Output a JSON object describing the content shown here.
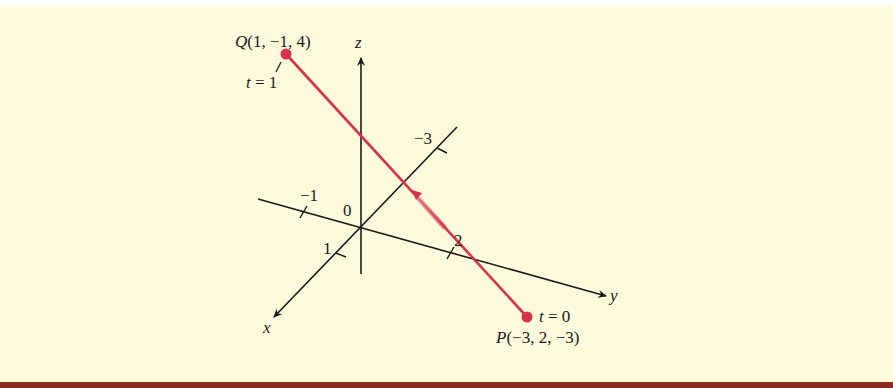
{
  "figure": {
    "background_color": "#fdfbdc",
    "bottom_bar_color": "#8a2a22",
    "line_color": "#d8314a",
    "axis_color": "#1a1a1a"
  },
  "axes": {
    "x_label": "x",
    "y_label": "y",
    "z_label": "z",
    "origin_label": "0",
    "ticks": {
      "x_pos": "1",
      "x_neg": "−1",
      "y_pos": "2",
      "y_neg": "−3"
    }
  },
  "points": {
    "Q": {
      "label": "Q(1, −1, 4)",
      "param": "t = 1",
      "coords": [
        1,
        -1,
        4
      ]
    },
    "P": {
      "label": "P(−3, 2, −3)",
      "param": "t = 0",
      "coords": [
        -3,
        2,
        -3
      ]
    }
  },
  "segment": {
    "from": "P",
    "to": "Q",
    "direction": "arrow from P toward Q"
  }
}
